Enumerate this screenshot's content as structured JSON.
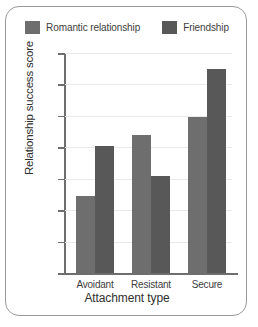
{
  "chart_data": {
    "type": "bar",
    "title": "",
    "xlabel": "Attachment type",
    "ylabel": "Relationship success score",
    "categories": [
      "Avoidant",
      "Resistant",
      "Secure"
    ],
    "series": [
      {
        "name": "Romantic relationship",
        "color": "#6e6e6e",
        "values": [
          24.5,
          44,
          49.5
        ]
      },
      {
        "name": "Friendship",
        "color": "#585858",
        "values": [
          40.5,
          31,
          65
        ]
      }
    ],
    "ylim": [
      0,
      70
    ],
    "ytick_step": 10,
    "yticks": [
      0,
      10,
      20,
      30,
      40,
      50,
      60,
      70
    ],
    "ytick_labels": [
      "0",
      "10",
      "20",
      "30",
      "40",
      "50",
      "60",
      "70"
    ],
    "grid": true,
    "grid_axis": "y",
    "grid_color": "#e9e9e9",
    "legend_position": "top-center",
    "axis_color": "#6e6e6e",
    "frame": true,
    "frame_color": "#9a9a9a",
    "background": "#ffffff"
  },
  "legend": {
    "entries": [
      {
        "label": "Romantic relationship"
      },
      {
        "label": "Friendship"
      }
    ]
  }
}
